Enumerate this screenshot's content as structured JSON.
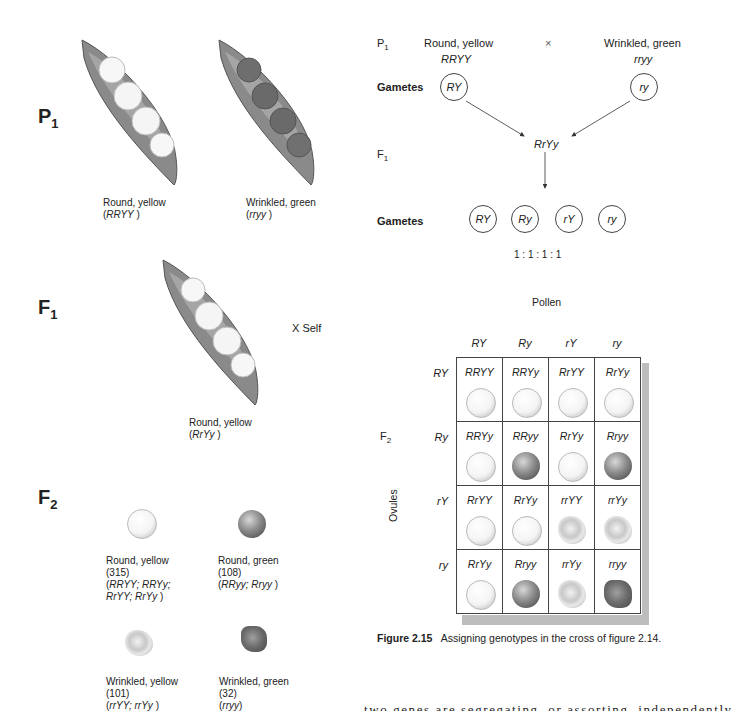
{
  "left_panel": {
    "p1": {
      "label": "P",
      "sub": "1",
      "pods": [
        {
          "phenotype": "Round, yellow",
          "genotype": "RRYY",
          "seed_type": "round-yellow"
        },
        {
          "phenotype": "Wrinkled, green",
          "genotype": "rryy",
          "seed_type": "wrinkled-green"
        }
      ]
    },
    "f1": {
      "label": "F",
      "sub": "1",
      "pod": {
        "phenotype": "Round, yellow",
        "genotype": "RrYy",
        "seed_type": "round-yellow"
      },
      "self_label": "X Self"
    },
    "f2": {
      "label": "F",
      "sub": "2",
      "classes": [
        {
          "phenotype": "Round, yellow",
          "count": "(315)",
          "genotypes_line1": "RRYY; RRYy;",
          "genotypes_line2": "RrYY; RrYy",
          "seed_type": "round-yellow"
        },
        {
          "phenotype": "Round, green",
          "count": "(108)",
          "genotypes_line1": "RRyy; Rryy",
          "genotypes_line2": "",
          "seed_type": "round-green"
        },
        {
          "phenotype": "Wrinkled, yellow",
          "count": "(101)",
          "genotypes_line1": "rrYY; rrYy",
          "genotypes_line2": "",
          "seed_type": "wrinkled-yellow"
        },
        {
          "phenotype": "Wrinkled, green",
          "count": "(32)",
          "genotypes_line1": "rryy",
          "genotypes_line2": "",
          "seed_type": "wrinkled-green"
        }
      ]
    }
  },
  "cross_diagram": {
    "p1_label": "P",
    "p1_sub": "1",
    "parent1_phenotype": "Round, yellow",
    "parent1_genotype": "RRYY",
    "cross_symbol": "×",
    "parent2_phenotype": "Wrinkled, green",
    "parent2_genotype": "rryy",
    "gametes_label": "Gametes",
    "parent1_gamete": "RY",
    "parent2_gamete": "ry",
    "f1_label": "F",
    "f1_sub": "1",
    "f1_genotype": "RrYy",
    "f1_gametes_label": "Gametes",
    "f1_gametes": [
      "RY",
      "Ry",
      "rY",
      "ry"
    ],
    "ratio": "1 : 1 : 1 : 1"
  },
  "punnett": {
    "pollen_label": "Pollen",
    "ovules_label": "Ovules",
    "f2_label": "F",
    "f2_sub": "2",
    "columns": [
      "RY",
      "Ry",
      "rY",
      "ry"
    ],
    "rows": [
      {
        "header": "RY",
        "cells": [
          {
            "genotype": "RRYY",
            "seed": "round-yellow"
          },
          {
            "genotype": "RRYy",
            "seed": "round-yellow"
          },
          {
            "genotype": "RrYY",
            "seed": "round-yellow"
          },
          {
            "genotype": "RrYy",
            "seed": "round-yellow"
          }
        ]
      },
      {
        "header": "Ry",
        "cells": [
          {
            "genotype": "RRYy",
            "seed": "round-yellow"
          },
          {
            "genotype": "RRyy",
            "seed": "round-green"
          },
          {
            "genotype": "RrYy",
            "seed": "round-yellow"
          },
          {
            "genotype": "Rryy",
            "seed": "round-green"
          }
        ]
      },
      {
        "header": "rY",
        "cells": [
          {
            "genotype": "RrYY",
            "seed": "round-yellow"
          },
          {
            "genotype": "RrYy",
            "seed": "round-yellow"
          },
          {
            "genotype": "rrYY",
            "seed": "wrinkled-yellow"
          },
          {
            "genotype": "rrYy",
            "seed": "wrinkled-yellow"
          }
        ]
      },
      {
        "header": "ry",
        "cells": [
          {
            "genotype": "RrYy",
            "seed": "round-yellow"
          },
          {
            "genotype": "Rryy",
            "seed": "round-green"
          },
          {
            "genotype": "rrYy",
            "seed": "wrinkled-yellow"
          },
          {
            "genotype": "rryy",
            "seed": "wrinkled-green"
          }
        ]
      }
    ]
  },
  "caption": {
    "figure_number": "Figure 2.15",
    "text": "Assigning genotypes in the cross of figure 2.14."
  },
  "body_text_fragment": "two genes are segregating, or assorting, independently"
}
